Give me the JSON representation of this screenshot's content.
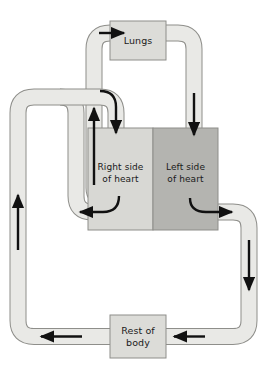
{
  "diagram": {
    "type": "flow-diagram",
    "canvas": {
      "width": 268,
      "height": 372
    },
    "colors": {
      "background": "#ffffff",
      "vessel_fill": "#e9e9e6",
      "vessel_stroke": "#8e8e8a",
      "right_heart_fill": "#d8d8d4",
      "left_heart_fill": "#b4b4b0",
      "box_fill": "#dcdcd8",
      "box_stroke": "#8e8e8a",
      "arrow": "#111111",
      "text": "#1a1a1a"
    },
    "nodes": [
      {
        "id": "lungs",
        "label": "Lungs",
        "label_line1": "Lungs",
        "label_line2": "",
        "x": 110,
        "y": 21,
        "width": 56,
        "height": 39
      },
      {
        "id": "right-heart",
        "label": "Right side of heart",
        "label_line1": "Right side",
        "label_line2": "of heart",
        "x": 88,
        "y": 128,
        "width": 65,
        "height": 102
      },
      {
        "id": "left-heart",
        "label": "Left side of heart",
        "label_line1": "Left side",
        "label_line2": "of heart",
        "x": 153,
        "y": 128,
        "width": 65,
        "height": 102
      },
      {
        "id": "rest-of-body",
        "label": "Rest of body",
        "label_line1": "Rest of",
        "label_line2": "body",
        "x": 110,
        "y": 315,
        "width": 56,
        "height": 43
      }
    ],
    "vessels": [
      {
        "id": "right-heart-to-lungs",
        "from": "right-heart",
        "to": "lungs",
        "description": "Deoxygenated blood from right side of heart up to lungs"
      },
      {
        "id": "lungs-to-left-heart",
        "from": "lungs",
        "to": "left-heart",
        "description": "Oxygenated blood from lungs down to left side of heart"
      },
      {
        "id": "left-heart-to-body",
        "from": "left-heart",
        "to": "rest-of-body",
        "description": "Oxygenated blood from left side of heart to rest of body"
      },
      {
        "id": "body-to-right-heart",
        "from": "rest-of-body",
        "to": "right-heart",
        "description": "Deoxygenated blood from rest of body back to right side of heart"
      }
    ],
    "arrows": [
      {
        "id": "arrow-into-lungs",
        "direction": "right",
        "near": "lungs"
      },
      {
        "id": "arrow-down-to-left-heart",
        "direction": "down",
        "near": "left-heart"
      },
      {
        "id": "arrow-out-of-left-heart",
        "direction": "right-curve",
        "near": "left-heart"
      },
      {
        "id": "arrow-down-right-side",
        "direction": "down",
        "near": "rest-of-body"
      },
      {
        "id": "arrow-into-rest-of-body",
        "direction": "left",
        "near": "rest-of-body"
      },
      {
        "id": "arrow-out-of-rest-of-body",
        "direction": "left",
        "near": "rest-of-body"
      },
      {
        "id": "arrow-up-left-side",
        "direction": "up",
        "near": "body-to-right-heart"
      },
      {
        "id": "arrow-down-into-right-heart",
        "direction": "down-curve",
        "near": "right-heart"
      },
      {
        "id": "arrow-out-of-right-heart",
        "direction": "left-curve",
        "near": "right-heart"
      },
      {
        "id": "arrow-up-to-lungs",
        "direction": "up",
        "near": "right-heart-to-lungs"
      }
    ]
  }
}
